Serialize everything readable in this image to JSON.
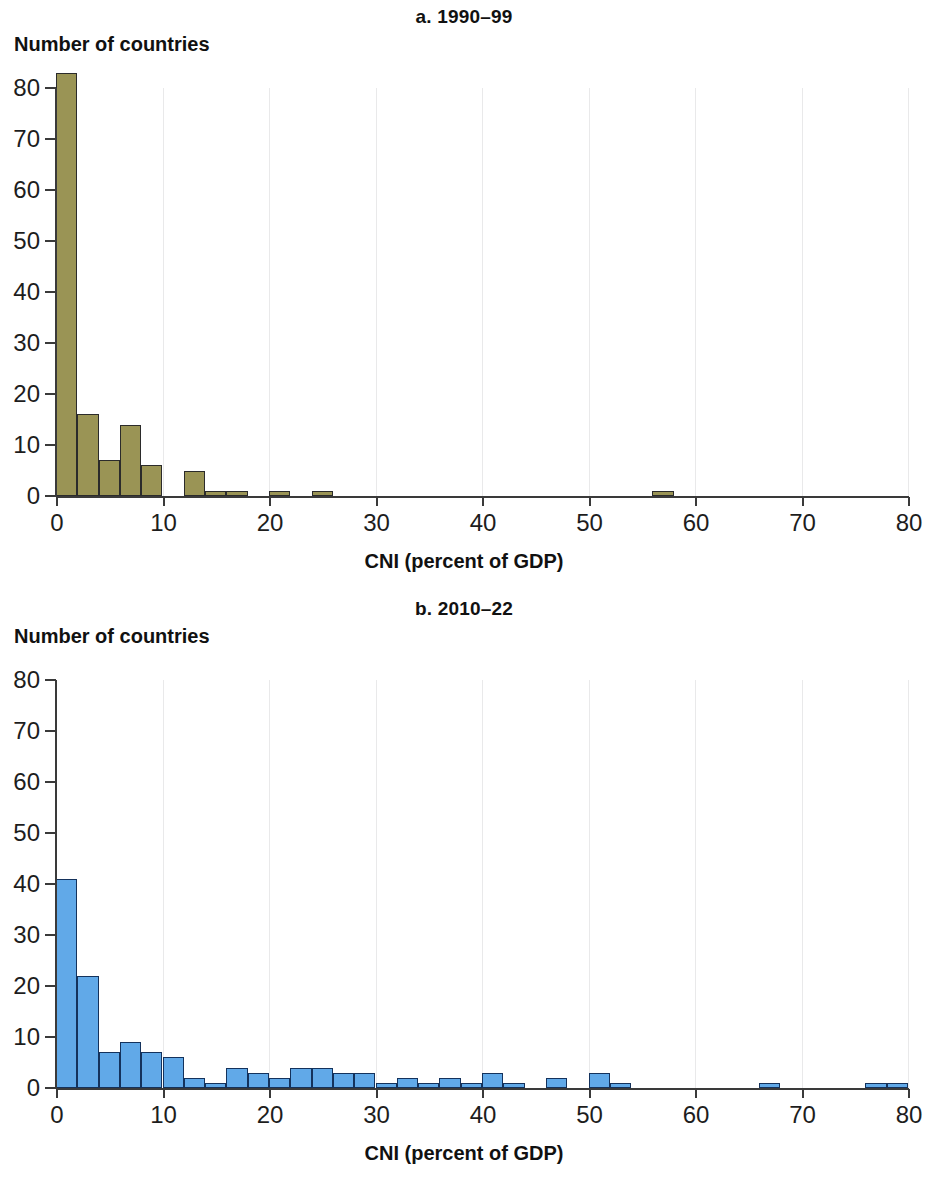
{
  "figure": {
    "x_axis_label": "CNI (percent of GDP)",
    "y_axis_label": "Number of countries",
    "x_ticks": [
      "0",
      "10",
      "20",
      "30",
      "40",
      "50",
      "60",
      "70",
      "80"
    ],
    "y_ticks": [
      "0",
      "10",
      "20",
      "30",
      "40",
      "50",
      "60",
      "70",
      "80"
    ],
    "colors": {
      "panel_a_bar_fill": "#9a9455",
      "panel_a_bar_edge": "#2b2b2b",
      "panel_b_bar_fill": "#61a9e8",
      "panel_b_bar_edge": "#14325c",
      "axis": "#3a3a3a",
      "gridline": "#e9e9ea",
      "text": "#111111"
    }
  },
  "panel_a": {
    "title": "a. 1990–99",
    "y_axis_label": "Number of countries",
    "x_axis_label": "CNI (percent of GDP)"
  },
  "panel_b": {
    "title": "b. 2010–22",
    "y_axis_label": "Number of countries",
    "x_axis_label": "CNI (percent of GDP)"
  },
  "chart_data": [
    {
      "type": "bar",
      "subtype": "histogram",
      "title": "a. 1990–99",
      "xlabel": "CNI (percent of GDP)",
      "ylabel": "Number of countries",
      "xlim": [
        0,
        80
      ],
      "ylim": [
        0,
        85
      ],
      "bin_width": 2,
      "grid": "vertical-at-x-ticks",
      "series_color": "#9a9455",
      "bins": [
        {
          "x0": 0,
          "x1": 2,
          "value": 83
        },
        {
          "x0": 2,
          "x1": 4,
          "value": 16
        },
        {
          "x0": 4,
          "x1": 6,
          "value": 7
        },
        {
          "x0": 6,
          "x1": 8,
          "value": 14
        },
        {
          "x0": 8,
          "x1": 10,
          "value": 6
        },
        {
          "x0": 10,
          "x1": 12,
          "value": 0
        },
        {
          "x0": 12,
          "x1": 14,
          "value": 5
        },
        {
          "x0": 14,
          "x1": 16,
          "value": 1
        },
        {
          "x0": 16,
          "x1": 18,
          "value": 1
        },
        {
          "x0": 18,
          "x1": 20,
          "value": 0
        },
        {
          "x0": 20,
          "x1": 22,
          "value": 1
        },
        {
          "x0": 22,
          "x1": 24,
          "value": 0
        },
        {
          "x0": 24,
          "x1": 26,
          "value": 1
        },
        {
          "x0": 56,
          "x1": 58,
          "value": 1
        }
      ]
    },
    {
      "type": "bar",
      "subtype": "histogram",
      "title": "b. 2010–22",
      "xlabel": "CNI (percent of GDP)",
      "ylabel": "Number of countries",
      "xlim": [
        0,
        80
      ],
      "ylim": [
        0,
        85
      ],
      "bin_width": 2,
      "grid": "vertical-at-x-ticks",
      "series_color": "#61a9e8",
      "bins": [
        {
          "x0": 0,
          "x1": 2,
          "value": 41
        },
        {
          "x0": 2,
          "x1": 4,
          "value": 22
        },
        {
          "x0": 4,
          "x1": 6,
          "value": 7
        },
        {
          "x0": 6,
          "x1": 8,
          "value": 9
        },
        {
          "x0": 8,
          "x1": 10,
          "value": 7
        },
        {
          "x0": 10,
          "x1": 12,
          "value": 6
        },
        {
          "x0": 12,
          "x1": 14,
          "value": 2
        },
        {
          "x0": 14,
          "x1": 16,
          "value": 1
        },
        {
          "x0": 16,
          "x1": 18,
          "value": 4
        },
        {
          "x0": 18,
          "x1": 20,
          "value": 3
        },
        {
          "x0": 20,
          "x1": 22,
          "value": 2
        },
        {
          "x0": 22,
          "x1": 24,
          "value": 4
        },
        {
          "x0": 24,
          "x1": 26,
          "value": 4
        },
        {
          "x0": 26,
          "x1": 28,
          "value": 3
        },
        {
          "x0": 28,
          "x1": 30,
          "value": 3
        },
        {
          "x0": 30,
          "x1": 32,
          "value": 1
        },
        {
          "x0": 32,
          "x1": 34,
          "value": 2
        },
        {
          "x0": 34,
          "x1": 36,
          "value": 1
        },
        {
          "x0": 36,
          "x1": 38,
          "value": 2
        },
        {
          "x0": 38,
          "x1": 40,
          "value": 1
        },
        {
          "x0": 40,
          "x1": 42,
          "value": 3
        },
        {
          "x0": 42,
          "x1": 44,
          "value": 1
        },
        {
          "x0": 46,
          "x1": 48,
          "value": 2
        },
        {
          "x0": 50,
          "x1": 52,
          "value": 3
        },
        {
          "x0": 52,
          "x1": 54,
          "value": 1
        },
        {
          "x0": 66,
          "x1": 68,
          "value": 1
        },
        {
          "x0": 76,
          "x1": 78,
          "value": 1
        },
        {
          "x0": 78,
          "x1": 80,
          "value": 1
        }
      ]
    }
  ]
}
